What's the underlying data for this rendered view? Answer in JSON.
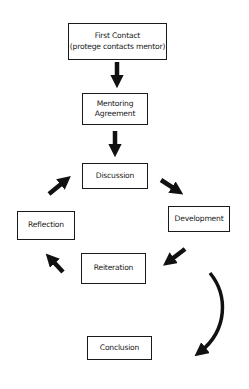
{
  "diagram": {
    "type": "flowchart",
    "nodes": [
      {
        "id": "first-contact",
        "label": "First Contact\n(protege contacts mentor)"
      },
      {
        "id": "mentoring-agreement",
        "label": "Mentoring\nAgreement"
      },
      {
        "id": "discussion",
        "label": "Discussion"
      },
      {
        "id": "development",
        "label": "Development"
      },
      {
        "id": "reiteration",
        "label": "Reiteration"
      },
      {
        "id": "reflection",
        "label": "Reflection"
      },
      {
        "id": "conclusion",
        "label": "Conclusion"
      }
    ],
    "edges": [
      {
        "from": "first-contact",
        "to": "mentoring-agreement"
      },
      {
        "from": "mentoring-agreement",
        "to": "discussion"
      },
      {
        "from": "discussion",
        "to": "development"
      },
      {
        "from": "development",
        "to": "reiteration"
      },
      {
        "from": "reiteration",
        "to": "reflection"
      },
      {
        "from": "reflection",
        "to": "discussion"
      },
      {
        "from": "reiteration",
        "to": "conclusion",
        "style": "curved"
      }
    ],
    "colors": {
      "stroke": "#1a1a1a",
      "background": "#ffffff"
    }
  }
}
